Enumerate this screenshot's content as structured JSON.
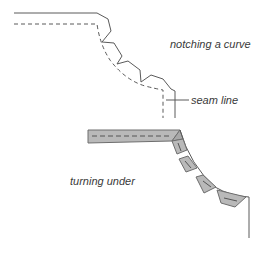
{
  "figure": {
    "top": {
      "caption": "notching a curve",
      "seam_label": "seam line"
    },
    "bottom": {
      "caption": "turning under"
    }
  },
  "colors": {
    "line": "#5a5a5a",
    "band_fill": "#b9b9b9",
    "band_stroke": "#6e6e6e",
    "text": "#3a3a3a"
  }
}
